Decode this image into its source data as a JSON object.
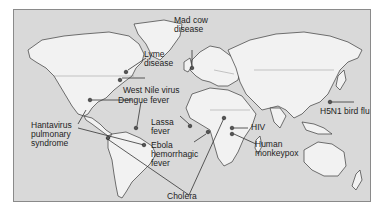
{
  "map": {
    "title": "Emerging infectious diseases world map",
    "colors": {
      "ocean": "#d9d9d9",
      "land": "#f2f2f2",
      "outline": "#3a3a3a",
      "text": "#1e1e1e"
    },
    "labels": {
      "mad_cow_line1": "Mad cow",
      "mad_cow_line2": "disease",
      "lyme_line1": "Lyme",
      "lyme_line2": "disease",
      "west_nile": "West Nile virus",
      "dengue": "Dengue fever",
      "hanta_line1": "Hantavirus",
      "hanta_line2": "pulmonary",
      "hanta_line3": "syndrome",
      "lassa_line1": "Lassa",
      "lassa_line2": "fever",
      "ebola_line1": "Ebola",
      "ebola_line2": "hemorrhagic",
      "ebola_line3": "fever",
      "cholera": "Cholera",
      "hiv": "HIV",
      "monkeypox_line1": "Human",
      "monkeypox_line2": "monkeypox",
      "h5n1": "H5N1 bird flu"
    }
  }
}
